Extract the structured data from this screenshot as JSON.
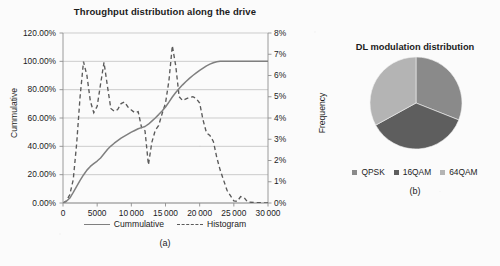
{
  "figure": {
    "background_color": "#fbfbfb",
    "panels": [
      "a",
      "b"
    ]
  },
  "panel_a": {
    "caption": "(a)",
    "axis_left_label": "Cummulative",
    "axis_right_label": "Frequency",
    "legend": [
      {
        "label": "Cummulative",
        "style": "solid",
        "color": "#7f7f7f"
      },
      {
        "label": "Histogram",
        "style": "dashed",
        "color": "#5a5a5a"
      }
    ]
  },
  "panel_b": {
    "caption": "(b)",
    "legend": [
      {
        "label": "QPSK",
        "color": "#8a8a8a"
      },
      {
        "label": "16QAM",
        "color": "#5e5e5e"
      },
      {
        "label": "64QAM",
        "color": "#b4b4b4"
      }
    ]
  },
  "chart_data": [
    {
      "type": "line",
      "panel": "a",
      "title": "Throughput distribution along the drive",
      "xlabel": "",
      "ylabel": "Cummulative",
      "y2label": "Frequency",
      "xlim": [
        0,
        30000
      ],
      "ylim": [
        0,
        1.2
      ],
      "y2lim": [
        0,
        0.08
      ],
      "grid": true,
      "legend_position": "bottom",
      "xticks": [
        0,
        5000,
        10000,
        15000,
        20000,
        25000,
        30000
      ],
      "xticklabels": [
        "0",
        "5000",
        "10000",
        "15000",
        "20000",
        "25000",
        "30000"
      ],
      "yticks": [
        0,
        0.2,
        0.4,
        0.6,
        0.8,
        1.0,
        1.2
      ],
      "yticklabels": [
        "0.00%",
        "20.00%",
        "40.00%",
        "60.00%",
        "80.00%",
        "100.00%",
        "120.00%"
      ],
      "y2ticks": [
        0,
        0.01,
        0.02,
        0.03,
        0.04,
        0.05,
        0.06,
        0.07,
        0.08
      ],
      "y2ticklabels": [
        "0%",
        "1%",
        "2%",
        "3%",
        "4%",
        "5%",
        "6%",
        "7%",
        "8%"
      ],
      "x": [
        0,
        500,
        1000,
        1500,
        2000,
        2500,
        3000,
        3500,
        4000,
        4500,
        5000,
        5500,
        6000,
        6500,
        7000,
        7500,
        8000,
        8500,
        9000,
        9500,
        10000,
        10500,
        11000,
        11500,
        12000,
        12500,
        13000,
        13500,
        14000,
        14500,
        15000,
        15500,
        16000,
        16500,
        17000,
        17500,
        18000,
        18500,
        19000,
        19500,
        20000,
        20500,
        21000,
        21500,
        22000,
        22500,
        23000,
        24000,
        25000,
        25500,
        26000,
        26500,
        27000,
        28000,
        29000,
        30000
      ],
      "series": [
        {
          "name": "Cummulative",
          "axis": "left",
          "style": "solid",
          "color": "#7f7f7f",
          "values": [
            0.0,
            0.012,
            0.035,
            0.075,
            0.118,
            0.16,
            0.198,
            0.232,
            0.258,
            0.278,
            0.296,
            0.318,
            0.348,
            0.378,
            0.402,
            0.422,
            0.44,
            0.458,
            0.472,
            0.486,
            0.5,
            0.512,
            0.524,
            0.532,
            0.54,
            0.556,
            0.578,
            0.6,
            0.624,
            0.65,
            0.678,
            0.712,
            0.748,
            0.78,
            0.808,
            0.834,
            0.858,
            0.88,
            0.9,
            0.918,
            0.936,
            0.952,
            0.968,
            0.98,
            0.99,
            0.997,
            1.0,
            1.0,
            1.0,
            1.0,
            1.0,
            1.0,
            1.0,
            1.0,
            1.0,
            1.0
          ]
        },
        {
          "name": "Histogram",
          "axis": "right",
          "style": "dashed",
          "color": "#5a5a5a",
          "values": [
            0.0,
            0.001,
            0.004,
            0.011,
            0.028,
            0.05,
            0.0665,
            0.06,
            0.048,
            0.0425,
            0.0455,
            0.056,
            0.0662,
            0.055,
            0.0445,
            0.0432,
            0.044,
            0.0468,
            0.0475,
            0.0452,
            0.0438,
            0.0425,
            0.043,
            0.0355,
            0.034,
            0.018,
            0.0285,
            0.0342,
            0.0365,
            0.042,
            0.047,
            0.0575,
            0.074,
            0.0645,
            0.05,
            0.0482,
            0.049,
            0.0497,
            0.05,
            0.0492,
            0.047,
            0.039,
            0.033,
            0.0318,
            0.029,
            0.0215,
            0.0155,
            0.006,
            0.001,
            0.0008,
            0.003,
            0.0026,
            0.0005,
            0.0002,
            0.0001,
            0.0
          ]
        }
      ]
    },
    {
      "type": "pie",
      "panel": "b",
      "title": "DL modulation distribution",
      "labels": [
        "QPSK",
        "16QAM",
        "64QAM"
      ],
      "values": [
        31,
        36,
        33
      ],
      "colors": [
        "#8a8a8a",
        "#5e5e5e",
        "#b4b4b4"
      ],
      "start_angle": 90,
      "direction": "clockwise",
      "legend_position": "bottom"
    }
  ]
}
